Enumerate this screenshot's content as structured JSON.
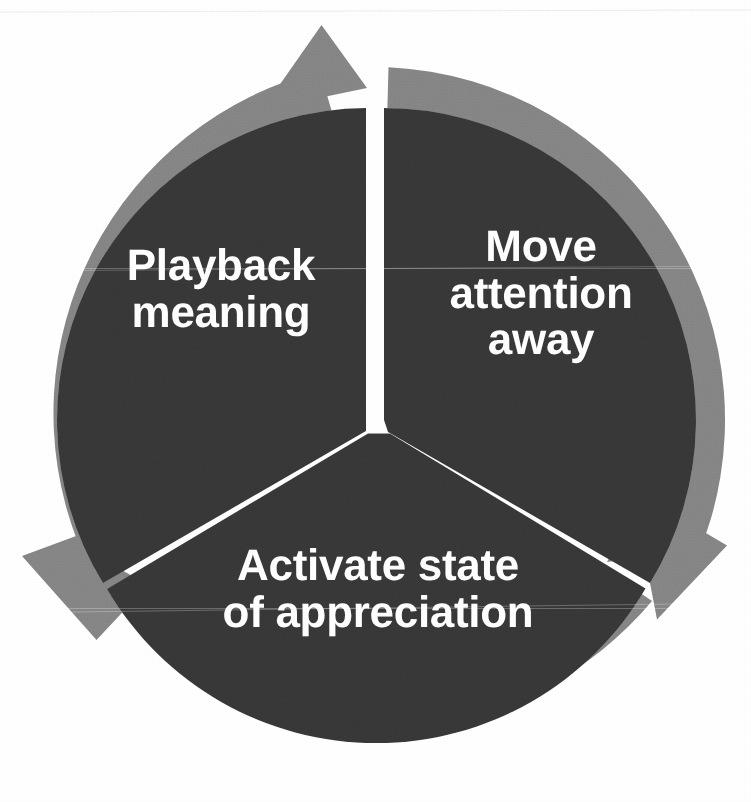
{
  "diagram": {
    "type": "cycle",
    "title": "",
    "direction": "clockwise",
    "segment_count": 3,
    "colors": {
      "outer_ring": "#8a8a8a",
      "segment_fill": "#3a3a3a",
      "divider": "#ffffff",
      "label_text": "#ffffff",
      "page_background": "#ffffff"
    },
    "geometry": {
      "center_x": 375,
      "center_y": 420,
      "outer_radius": 353,
      "inner_radius": 312,
      "divider_angles_deg": [
        90,
        210,
        330
      ]
    },
    "segments": [
      {
        "id": "playback-meaning",
        "label": "Playback\nmeaning",
        "lines": [
          "Playback",
          "meaning"
        ],
        "position": "left",
        "order": 3
      },
      {
        "id": "move-attention-away",
        "label": "Move\nattention\naway",
        "lines": [
          "Move",
          "attention",
          "away"
        ],
        "position": "right",
        "order": 1
      },
      {
        "id": "activate-state-of-appreciation",
        "label": "Activate state\nof appreciation",
        "lines": [
          "Activate state",
          "of appreciation"
        ],
        "position": "bottom",
        "order": 2
      }
    ],
    "arrows": [
      {
        "id": "arrow-top",
        "points_to": "move-attention-away",
        "direction": "clockwise",
        "location": "top"
      },
      {
        "id": "arrow-right",
        "points_to": "activate-state-of-appreciation",
        "direction": "clockwise",
        "location": "lower-right"
      },
      {
        "id": "arrow-left",
        "points_to": "playback-meaning",
        "direction": "clockwise",
        "location": "lower-left"
      }
    ]
  }
}
